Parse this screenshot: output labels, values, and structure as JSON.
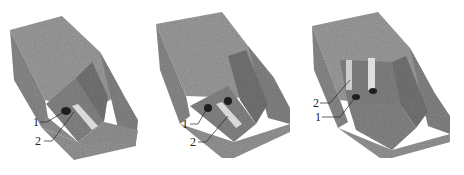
{
  "figure": {
    "panels": [
      {
        "id": "a",
        "callouts": [
          {
            "number": "1",
            "target": "dark-hole"
          },
          {
            "number": "2",
            "target": "light-slot"
          }
        ]
      },
      {
        "id": "b",
        "callouts": [
          {
            "number": "1",
            "target": "dark-holes"
          },
          {
            "number": "2",
            "target": "light-slot"
          }
        ]
      },
      {
        "id": "c",
        "callouts": [
          {
            "number": "2",
            "target": "light-vertical-slots"
          },
          {
            "number": "1",
            "target": "dark-holes"
          }
        ]
      }
    ],
    "colors": {
      "stone_top": "#a3a3a3",
      "stone_front": "#8e8e8e",
      "stone_side": "#7d7d7d",
      "stone_inner": "#6f6f6f",
      "hole": "#1e1e1e",
      "slot": "#e4e4e4",
      "leader": "#222222"
    }
  }
}
